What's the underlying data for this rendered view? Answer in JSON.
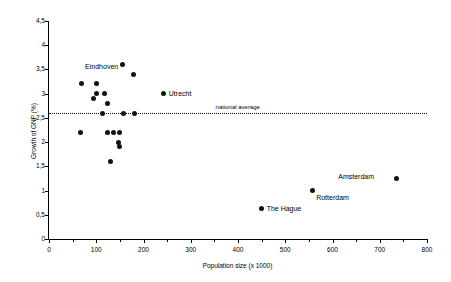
{
  "chart_data": {
    "type": "scatter",
    "title": "",
    "xlabel": "Population size (x 1000)",
    "ylabel": "Growth of GNP (%)",
    "xlim": [
      0,
      800
    ],
    "ylim": [
      0,
      4.5
    ],
    "xticks": [
      0,
      100,
      200,
      300,
      400,
      500,
      600,
      700,
      800
    ],
    "xtick_labels": [
      "0",
      "100",
      "200",
      "300",
      "400",
      "500",
      "600",
      "700",
      "800"
    ],
    "xminor_ticks": [
      50,
      150,
      250,
      350,
      450,
      550,
      650,
      750
    ],
    "yticks": [
      0,
      0.5,
      1,
      1.5,
      2,
      2.5,
      3,
      3.5,
      4,
      4.5
    ],
    "ytick_labels": [
      "0",
      "0,5",
      "1",
      "1,5",
      "2",
      "2,5",
      "3",
      "3,5",
      "4",
      "4,5"
    ],
    "grid": false,
    "legend": null,
    "marker": "filled-circle",
    "marker_color": "#111111",
    "reference_line": {
      "label": "national average",
      "value": 2.6,
      "style": "dotted",
      "label_x": 560
    },
    "points": [
      {
        "x": 68,
        "y": 3.2,
        "label": ""
      },
      {
        "x": 100,
        "y": 3.0,
        "label": ""
      },
      {
        "x": 100,
        "y": 3.2,
        "label": ""
      },
      {
        "x": 95,
        "y": 2.9,
        "label": ""
      },
      {
        "x": 118,
        "y": 3.0,
        "label": ""
      },
      {
        "x": 123,
        "y": 2.8,
        "label": ""
      },
      {
        "x": 155,
        "y": 3.6,
        "label": ""
      },
      {
        "x": 178,
        "y": 3.4,
        "label": "Eindhoven"
      },
      {
        "x": 243,
        "y": 3.0,
        "label": "Utrecht"
      },
      {
        "x": 113,
        "y": 2.6,
        "label": ""
      },
      {
        "x": 158,
        "y": 2.6,
        "label": ""
      },
      {
        "x": 180,
        "y": 2.6,
        "label": ""
      },
      {
        "x": 66,
        "y": 2.2,
        "label": ""
      },
      {
        "x": 124,
        "y": 2.2,
        "label": ""
      },
      {
        "x": 137,
        "y": 2.2,
        "label": ""
      },
      {
        "x": 150,
        "y": 2.2,
        "label": ""
      },
      {
        "x": 148,
        "y": 2.0,
        "label": ""
      },
      {
        "x": 150,
        "y": 1.9,
        "label": ""
      },
      {
        "x": 130,
        "y": 1.6,
        "label": ""
      },
      {
        "x": 450,
        "y": 0.62,
        "label": "The Hague"
      },
      {
        "x": 557,
        "y": 1.0,
        "label": "Rotterdam"
      },
      {
        "x": 735,
        "y": 1.25,
        "label": "Amsterdam"
      }
    ],
    "annotations": [
      {
        "text": "Eindhoven",
        "x": 178,
        "y": 3.4,
        "placement": "left"
      },
      {
        "text": "Utrecht",
        "x": 243,
        "y": 3.0,
        "placement": "right"
      },
      {
        "text": "Amsterdam",
        "x": 735,
        "y": 1.25,
        "placement": "left"
      },
      {
        "text": "Rotterdam",
        "x": 557,
        "y": 1.0,
        "placement": "below-right"
      },
      {
        "text": "The Hague",
        "x": 450,
        "y": 0.62,
        "placement": "right"
      },
      {
        "text": "national average",
        "x": 560,
        "y": 2.6,
        "placement": "on-line"
      }
    ]
  }
}
